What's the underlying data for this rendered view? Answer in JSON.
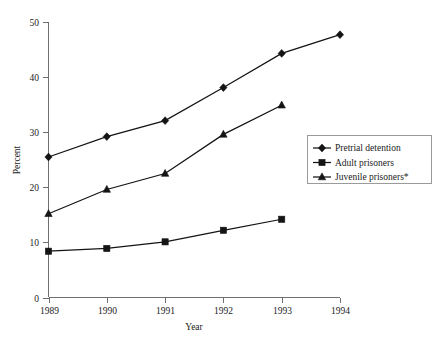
{
  "chart_data": {
    "type": "line",
    "title": "",
    "subtitle": "",
    "xlabel": "Year",
    "ylabel": "Percent",
    "categories": [
      "1989",
      "1990",
      "1991",
      "1992",
      "1993",
      "1994"
    ],
    "x": [
      1989,
      1990,
      1991,
      1992,
      1993,
      1994
    ],
    "xlim": [
      1989,
      1994
    ],
    "ylim": [
      0,
      50
    ],
    "yticks": [
      0,
      10,
      20,
      30,
      40,
      50
    ],
    "ytick_labels": [
      "0",
      "10",
      "20",
      "30",
      "40",
      "50"
    ],
    "xticks": [
      1989,
      1990,
      1991,
      1992,
      1993,
      1994
    ],
    "xtick_labels": [
      "1989",
      "1990",
      "1991",
      "1992",
      "1993",
      "1994"
    ],
    "grid": false,
    "legend_position": "right",
    "series": [
      {
        "name": "Pretrial detention",
        "marker": "diamond",
        "color": "#141414",
        "x": [
          1989,
          1990,
          1991,
          1992,
          1993,
          1994
        ],
        "values": [
          25.5,
          29.2,
          32.1,
          38.1,
          44.3,
          47.7
        ]
      },
      {
        "name": "Adult prisoners",
        "marker": "square",
        "color": "#141414",
        "x": [
          1989,
          1990,
          1991,
          1992,
          1993
        ],
        "values": [
          8.4,
          8.9,
          10.1,
          12.2,
          14.2
        ]
      },
      {
        "name": "Juvenile prisoners*",
        "marker": "triangle",
        "color": "#141414",
        "x": [
          1989,
          1990,
          1991,
          1992,
          1993
        ],
        "values": [
          15.2,
          19.6,
          22.5,
          29.6,
          34.9
        ]
      }
    ]
  },
  "legend": {
    "items": [
      {
        "label": "Pretrial detention",
        "marker": "diamond"
      },
      {
        "label": "Adult prisoners",
        "marker": "square"
      },
      {
        "label": "Juvenile prisoners*",
        "marker": "triangle"
      }
    ]
  },
  "axes": {
    "x_title": "Year",
    "y_title": "Percent"
  }
}
